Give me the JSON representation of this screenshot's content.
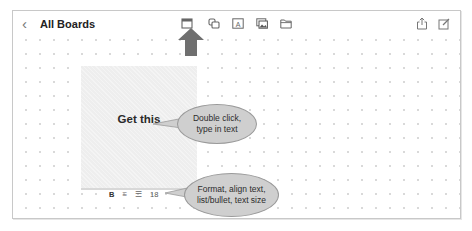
{
  "header": {
    "back_icon": "chevron-left-icon",
    "back_glyph": "‹",
    "title": "All Boards"
  },
  "toolbar": {
    "items": [
      {
        "name": "sticky-note-icon",
        "label": "Sticky note"
      },
      {
        "name": "shapes-icon",
        "label": "Shapes"
      },
      {
        "name": "text-box-icon",
        "label": "Text box",
        "glyph": "A"
      },
      {
        "name": "media-icon",
        "label": "Media"
      },
      {
        "name": "folder-icon",
        "label": "Files"
      }
    ],
    "right": [
      {
        "name": "share-icon",
        "label": "Share"
      },
      {
        "name": "edit-icon",
        "label": "New board"
      }
    ]
  },
  "note": {
    "text": "Get this",
    "color": "#eeeeee"
  },
  "format_bar": {
    "bold": "B",
    "align_glyph": "≡",
    "list_glyph": "☰",
    "text_size": "18"
  },
  "annotations": {
    "arrow_color": "#6f6f6f",
    "callout_color": "#cfcfcf",
    "callout1_line1": "Double click,",
    "callout1_line2": "type in text",
    "callout2_line1": "Format, align text,",
    "callout2_line2": "list/bullet, text size"
  }
}
